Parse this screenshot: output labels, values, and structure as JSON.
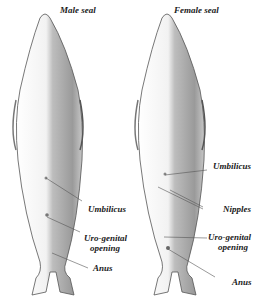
{
  "figure": {
    "male": {
      "title": "Male seal",
      "labels": {
        "umbilicus": "Umbilicus",
        "urogenital_1": "Uro-genital",
        "urogenital_2": "opening",
        "anus": "Anus"
      }
    },
    "female": {
      "title": "Female seal",
      "labels": {
        "umbilicus": "Umbilicus",
        "nipples": "Nipples",
        "urogenital_1": "Uro-genital",
        "urogenital_2": "opening",
        "anus": "Anus"
      }
    },
    "colors": {
      "outline": "#555555",
      "shade_dark": "#8a8a8a",
      "shade_light": "#e6e6e6",
      "text": "#1a1a1a"
    }
  }
}
